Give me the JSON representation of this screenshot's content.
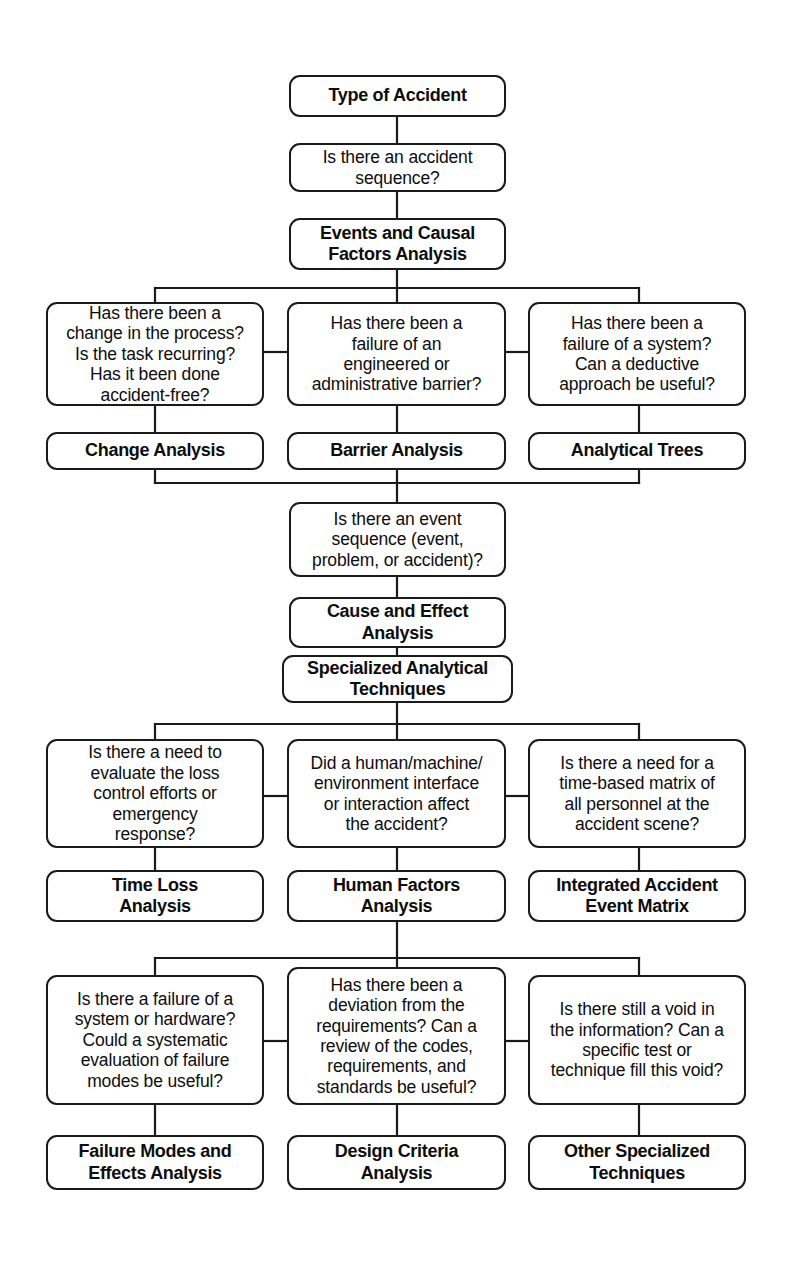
{
  "diagram": {
    "line_color": "#1a1a1a",
    "text_color": "#0d0d0d",
    "background": "#ffffff"
  },
  "nodes": {
    "type_of_accident": "Type of Accident",
    "q_accident_sequence": "Is there an accident\nsequence?",
    "events_causal_factors": "Events and Causal\nFactors Analysis",
    "q_change_process": "Has there been a\nchange in the process?\nIs the task recurring?\nHas it been done\naccident-free?",
    "q_barrier_failure": "Has there been a\nfailure of an\nengineered or\nadministrative barrier?",
    "q_system_failure": "Has there been a\nfailure of a system?\nCan a deductive\napproach be useful?",
    "change_analysis": "Change Analysis",
    "barrier_analysis": "Barrier Analysis",
    "analytical_trees": "Analytical Trees",
    "q_event_sequence": "Is there an event\nsequence (event,\nproblem, or accident)?",
    "cause_and_effect": "Cause and Effect\nAnalysis",
    "specialized_techniques": "Specialized Analytical\nTechniques",
    "q_loss_control": "Is there a need to\nevaluate the loss\ncontrol efforts or\nemergency\nresponse?",
    "q_human_machine": "Did a human/machine/\nenvironment interface\nor interaction affect\nthe accident?",
    "q_time_matrix": "Is there a need for a\ntime-based matrix of\nall personnel at the\naccident scene?",
    "time_loss_analysis": "Time Loss\nAnalysis",
    "human_factors_analysis": "Human Factors\nAnalysis",
    "integrated_accident_matrix": "Integrated Accident\nEvent Matrix",
    "q_system_hardware": "Is there a failure of a\nsystem or hardware?\nCould a systematic\nevaluation of failure\nmodes be useful?",
    "q_deviation_requirements": "Has there been a\ndeviation from the\nrequirements? Can a\nreview of the codes,\nrequirements, and\nstandards be useful?",
    "q_void_information": "Is there still a void in\nthe information? Can a\nspecific test or\ntechnique fill this void?",
    "failure_modes_effects": "Failure Modes and\nEffects Analysis",
    "design_criteria": "Design Criteria\nAnalysis",
    "other_specialized": "Other Specialized\nTechniques"
  }
}
